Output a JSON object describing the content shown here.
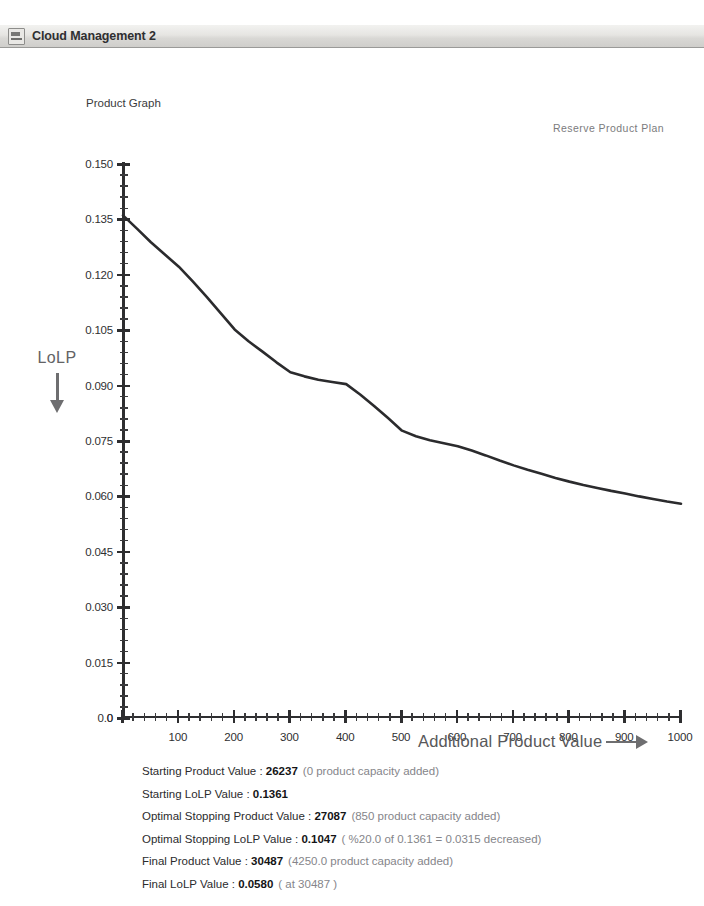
{
  "window": {
    "title": "Cloud Management 2",
    "icon": "app-window-icon"
  },
  "chart_header": {
    "graph_title": "Product Graph",
    "plan_label": "Reserve Product Plan"
  },
  "axes": {
    "y_annotation": "LoLP",
    "y_arrow_icon": "down-arrow-icon",
    "x_title": "Additional Product Value",
    "x_arrow_icon": "right-arrow-icon"
  },
  "summary": {
    "rows": [
      {
        "label": "Starting Product Value : ",
        "value": "26237",
        "note": "(0 product capacity added)"
      },
      {
        "label": "Starting  LoLP Value : ",
        "value": "0.1361",
        "note": ""
      },
      {
        "label": "Optimal Stopping Product Value : ",
        "value": "27087",
        "note": "(850 product capacity added)"
      },
      {
        "label": "Optimal Stopping  LoLP Value : ",
        "value": "0.1047",
        "note": "( %20.0 of 0.1361 = 0.0315 decreased)"
      },
      {
        "label": "Final Product Value : ",
        "value": "30487",
        "note": "(4250.0 product capacity added)"
      },
      {
        "label": "Final LoLP Value : ",
        "value": "0.0580",
        "note": "( at 30487 )"
      }
    ]
  },
  "chart_data": {
    "type": "line",
    "title": "Product Graph",
    "subtitle": "Reserve Product Plan",
    "xlabel": "Additional Product Value",
    "ylabel": "LoLP",
    "xlim": [
      0,
      1000
    ],
    "ylim": [
      0.0,
      0.15
    ],
    "grid": false,
    "legend": null,
    "line_color": "#2b2b2d",
    "x_ticks": [
      0,
      100,
      200,
      300,
      400,
      500,
      600,
      700,
      800,
      900,
      1000
    ],
    "x_tick_labels": [
      "0",
      "100",
      "200",
      "300",
      "400",
      "500",
      "600",
      "700",
      "800",
      "900",
      "1000"
    ],
    "x_minor_step": 20,
    "y_ticks": [
      0.0,
      0.015,
      0.03,
      0.045,
      0.06,
      0.075,
      0.09,
      0.105,
      0.12,
      0.135,
      0.15
    ],
    "y_tick_labels": [
      "0.0",
      "0.015",
      "0.030",
      "0.045",
      "0.060",
      "0.075",
      "0.090",
      "0.105",
      "0.120",
      "0.135",
      "0.150"
    ],
    "y_minor_step": 0.003,
    "series": [
      {
        "name": "LoLP",
        "x": [
          0,
          25,
          50,
          75,
          100,
          125,
          150,
          175,
          200,
          225,
          250,
          275,
          300,
          325,
          350,
          375,
          400,
          425,
          450,
          475,
          500,
          525,
          550,
          575,
          600,
          625,
          650,
          675,
          700,
          725,
          750,
          775,
          800,
          825,
          850,
          875,
          900,
          925,
          950,
          975,
          1000
        ],
        "y": [
          0.1361,
          0.1325,
          0.1288,
          0.1255,
          0.1222,
          0.1182,
          0.114,
          0.1096,
          0.1052,
          0.102,
          0.0992,
          0.0963,
          0.0936,
          0.0925,
          0.0916,
          0.091,
          0.0904,
          0.0876,
          0.0845,
          0.0812,
          0.0778,
          0.0763,
          0.0752,
          0.0744,
          0.0736,
          0.0724,
          0.0711,
          0.0697,
          0.0684,
          0.0672,
          0.0661,
          0.065,
          0.064,
          0.0631,
          0.0623,
          0.0615,
          0.0608,
          0.06,
          0.0593,
          0.0586,
          0.058
        ]
      }
    ],
    "markers": {
      "start": {
        "x": 0,
        "y": 0.1361
      },
      "optimal_stopping": {
        "x": 850,
        "y": 0.1047
      },
      "final": {
        "x": 4250,
        "y": 0.058
      }
    }
  }
}
